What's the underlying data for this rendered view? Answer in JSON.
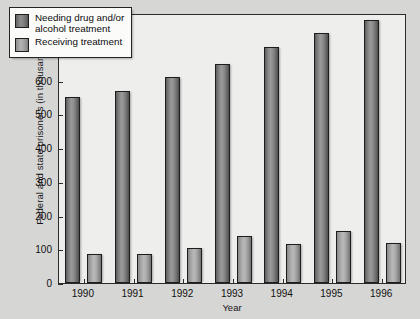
{
  "chart_data": {
    "type": "bar",
    "title": "",
    "xlabel": "Year",
    "ylabel": "Federal and state prisoners (in thousands)",
    "categories": [
      "1990",
      "1991",
      "1992",
      "1993",
      "1994",
      "1995",
      "1996"
    ],
    "series": [
      {
        "name": "Needing drug and/or\nalcohol treatment",
        "legend_label_line1": "Needing drug and/or",
        "legend_label_line2": "alcohol treatment",
        "color": "#7d7d7d",
        "values": [
          550,
          570,
          610,
          648,
          698,
          742,
          780
        ]
      },
      {
        "name": "Receiving treatment",
        "legend_label_line1": "Receiving treatment",
        "legend_label_line2": "",
        "color": "#a8a8a8",
        "values": [
          85,
          85,
          105,
          140,
          115,
          155,
          120
        ]
      }
    ],
    "ylim": [
      0,
      800
    ],
    "yticks": [
      0,
      100,
      200,
      300,
      400,
      500,
      600,
      700,
      800
    ],
    "ytick_labels": [
      "0",
      "100",
      "200",
      "300",
      "400",
      "500",
      "600",
      "700",
      "800"
    ],
    "grid": false,
    "legend_position": "top-left"
  },
  "colors": {
    "figure_background": "#d6d6d4",
    "plot_background": "#eeeeec",
    "axis": "#2b2b2b",
    "text": "#111111",
    "legend_background": "#fbfbfa"
  }
}
